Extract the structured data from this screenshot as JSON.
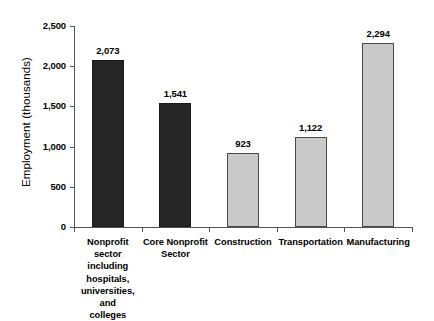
{
  "chart_data": {
    "type": "bar",
    "title": "",
    "subtitle": "",
    "xlabel": "",
    "ylabel": "Employment (thousands)",
    "categories": [
      "Nonprofit sector including hospitals, universities, and colleges",
      "Core Nonprofit Sector",
      "Construction",
      "Transportation",
      "Manufacturing"
    ],
    "category_lines": [
      [
        "Nonprofit sector",
        "including",
        "hospitals,",
        "universities, and",
        "colleges"
      ],
      [
        "Core Nonprofit",
        "Sector"
      ],
      [
        "Construction"
      ],
      [
        "Transportation"
      ],
      [
        "Manufacturing"
      ]
    ],
    "values": [
      2073,
      1541,
      923,
      1122,
      2294
    ],
    "value_labels": [
      "2,073",
      "1,541",
      "923",
      "1,122",
      "2,294"
    ],
    "bar_colors": [
      "#262626",
      "#262626",
      "#c9c9c9",
      "#c9c9c9",
      "#c9c9c9"
    ],
    "ylim": [
      0,
      2500
    ],
    "ytick_values": [
      0,
      500,
      1000,
      1500,
      2000,
      2500
    ],
    "ytick_labels": [
      "0",
      "500",
      "1,000",
      "1,500",
      "2,000",
      "2,500"
    ],
    "grid": false,
    "legend": "none",
    "axis_color": "#555555",
    "background": "#ffffff"
  },
  "axis": {
    "y_title": "Employment (thousands)"
  }
}
